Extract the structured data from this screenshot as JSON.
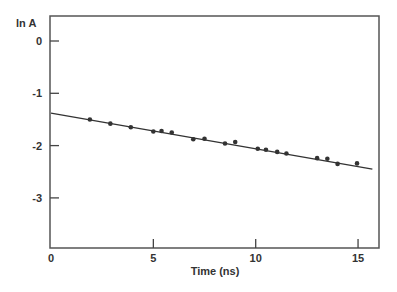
{
  "chart_data": {
    "type": "scatter",
    "title": "",
    "xlabel": "Time (ns)",
    "ylabel": "ln A",
    "xlim": [
      0,
      16.2
    ],
    "ylim": [
      -4,
      0.5
    ],
    "xticks": [
      0,
      5,
      10,
      15
    ],
    "yticks": [
      0,
      -1,
      -2,
      -3
    ],
    "xtick_labels": [
      "0",
      "5",
      "10",
      "15"
    ],
    "ytick_labels": [
      "0",
      "-1",
      "-2",
      "-3"
    ],
    "grid": false,
    "legend": null,
    "series": [
      {
        "name": "data",
        "kind": "points",
        "x": [
          1.9,
          2.9,
          3.9,
          5.0,
          5.4,
          5.9,
          6.95,
          7.5,
          8.5,
          9.0,
          10.1,
          10.5,
          11.05,
          11.5,
          13.0,
          13.5,
          14.0,
          14.95
        ],
        "y": [
          -1.5,
          -1.58,
          -1.65,
          -1.73,
          -1.72,
          -1.75,
          -1.88,
          -1.87,
          -1.96,
          -1.93,
          -2.06,
          -2.08,
          -2.12,
          -2.15,
          -2.24,
          -2.25,
          -2.35,
          -2.34
        ]
      },
      {
        "name": "linear fit",
        "kind": "line",
        "x": [
          0,
          15.7
        ],
        "y": [
          -1.38,
          -2.45
        ]
      }
    ],
    "colors": {
      "axis": "#444444",
      "points": "#333333",
      "line": "#333333",
      "text": "#333333"
    }
  }
}
